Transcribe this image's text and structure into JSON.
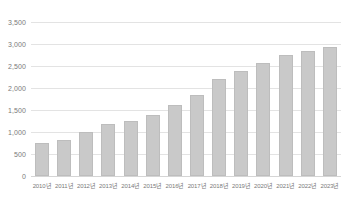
{
  "chart_data": {
    "type": "bar",
    "title": "",
    "subtitle": "",
    "xlabel": "",
    "ylabel": "",
    "categories": [
      "2010년",
      "2011년",
      "2012년",
      "2013년",
      "2014년",
      "2015년",
      "2016년",
      "2017년",
      "2018년",
      "2019년",
      "2020년",
      "2021년",
      "2022년",
      "2023년"
    ],
    "values": [
      750,
      820,
      990,
      1190,
      1240,
      1390,
      1620,
      1840,
      2210,
      2380,
      2560,
      2740,
      2840,
      2940
    ],
    "series": [
      {
        "name": "",
        "values": [
          750,
          820,
          990,
          1190,
          1240,
          1390,
          1620,
          1840,
          2210,
          2380,
          2560,
          2740,
          2840,
          2940
        ]
      }
    ],
    "ylim": [
      0,
      3500
    ],
    "ytick_values": [
      0,
      500,
      1000,
      1500,
      2000,
      2500,
      3000,
      3500
    ],
    "ytick_labels": [
      "0",
      "500",
      "1,000",
      "1,500",
      "2,000",
      "2,500",
      "3,000",
      "3,500"
    ],
    "grid": true,
    "grid_axis": "y",
    "legend": false,
    "legend_position": "none",
    "bar_color": "#c9c9c9",
    "bar_border_color": "#bdbdbd",
    "gridline_color": "#e3e3e3",
    "axis_label_color": "#7a7a7a",
    "background_color": "#ffffff",
    "annotations": []
  }
}
